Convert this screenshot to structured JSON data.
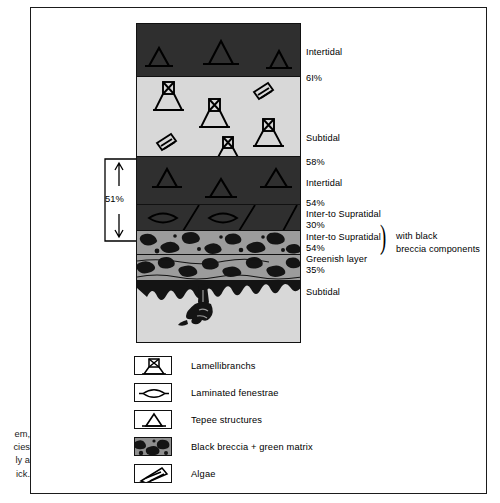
{
  "figure": {
    "type": "stratigraphic-column",
    "title": ""
  },
  "column": {
    "beds": [
      {
        "id": "bed-1",
        "facies": "Intertidal",
        "percent": "61%",
        "fill": "dark",
        "symbols": "tepee-structures"
      },
      {
        "id": "bed-2",
        "facies": "Subtidal",
        "percent": "58%",
        "fill": "light",
        "symbols": "lamellibranchs-and-algae"
      },
      {
        "id": "bed-3",
        "facies": "Intertidal",
        "percent": "54%",
        "fill": "dark",
        "symbols": "tepee-structures"
      },
      {
        "id": "bed-4",
        "facies": "Inter- to Supratidal",
        "percent": "30%",
        "fill": "dark",
        "symbols": "laminated-fenestrae"
      },
      {
        "id": "bed-5",
        "facies": "Inter- to Supratidal",
        "percent": "54%",
        "fill": "breccia",
        "symbols": "black-breccia"
      },
      {
        "id": "bed-6",
        "facies": "Greenish layer",
        "percent": "35%",
        "fill": "breccia",
        "symbols": "black-breccia"
      },
      {
        "id": "bed-7",
        "facies": "Subtidal",
        "percent": "",
        "fill": "light",
        "symbols": "burrow-pipe"
      }
    ]
  },
  "labels": {
    "intertidal_1": "Intertidal",
    "pct_61": "6I%",
    "subtidal_1": "Subtidal",
    "pct_58": "58%",
    "intertidal_2": "Intertidal",
    "pct_54_a": "54%",
    "inter_supratidal_1": "Inter-to Supratidal",
    "pct_30": "30%",
    "inter_supratidal_2": "Inter-to Supratidal",
    "pct_54_b": "54%",
    "greenish_layer": "Greenish layer",
    "pct_35": "35%",
    "subtidal_2": "Subtidal",
    "breccia_note_line1": "with black",
    "breccia_note_line2": "breccia components"
  },
  "bracket": {
    "label": "51%"
  },
  "legend": {
    "items": [
      {
        "icon": "lamellibranch-icon",
        "label": "Lamellibranchs"
      },
      {
        "icon": "fenestrae-icon",
        "label": "Laminated  fenestrae"
      },
      {
        "icon": "tepee-icon",
        "label": "Tepee  structures"
      },
      {
        "icon": "breccia-icon",
        "label": "Black breccia  +  green matrix"
      },
      {
        "icon": "algae-icon",
        "label": "Algae"
      }
    ]
  },
  "caption": {
    "line1": "em,",
    "line2": "cies",
    "line3": "ly a",
    "line4": "ick."
  },
  "colors": {
    "dark_bed": "#2f2f2f",
    "light_bed": "#d8d8d8",
    "breccia_matrix": "#9c9c9c",
    "ink": "#111111",
    "page": "#ffffff"
  }
}
